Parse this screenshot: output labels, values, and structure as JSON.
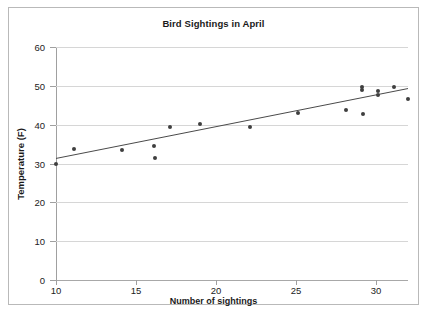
{
  "chart_data": {
    "type": "scatter",
    "title": "Bird Sightings in April",
    "xlabel": "Number of sightings",
    "ylabel": "Temperature (F)",
    "xlim": [
      10,
      32
    ],
    "ylim": [
      0,
      60
    ],
    "xticks": [
      10,
      15,
      20,
      25,
      30
    ],
    "yticks": [
      0,
      10,
      20,
      30,
      40,
      50,
      60
    ],
    "grid": "horizontal",
    "legend": "none",
    "series": [
      {
        "name": "Sightings vs Temperature",
        "marker": "diamond",
        "color": "#3f3f3f",
        "points": [
          {
            "x": 10.0,
            "y": 30.0
          },
          {
            "x": 11.1,
            "y": 33.8
          },
          {
            "x": 14.1,
            "y": 33.6
          },
          {
            "x": 16.1,
            "y": 34.5
          },
          {
            "x": 16.2,
            "y": 31.5
          },
          {
            "x": 17.1,
            "y": 39.5
          },
          {
            "x": 19.0,
            "y": 40.3
          },
          {
            "x": 22.1,
            "y": 39.3
          },
          {
            "x": 25.1,
            "y": 43.0
          },
          {
            "x": 28.1,
            "y": 43.9
          },
          {
            "x": 29.1,
            "y": 49.7
          },
          {
            "x": 29.1,
            "y": 48.9
          },
          {
            "x": 29.2,
            "y": 42.8
          },
          {
            "x": 30.1,
            "y": 48.6
          },
          {
            "x": 30.1,
            "y": 47.7
          },
          {
            "x": 31.1,
            "y": 49.7
          },
          {
            "x": 32.0,
            "y": 46.6
          }
        ]
      }
    ],
    "trendline": {
      "name": "Linear trendline",
      "color": "#4a4a4a",
      "x_start": 10.0,
      "y_start": 31.3,
      "x_end": 32.0,
      "y_end": 49.3
    }
  }
}
